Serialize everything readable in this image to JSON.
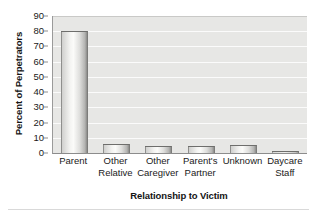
{
  "chart_data": {
    "type": "bar",
    "title": "",
    "subtitle": "",
    "xlabel": "Relationship to Victim",
    "ylabel": "Percent of Perpetrators",
    "categories": [
      "Parent",
      "Other Relative",
      "Other Caregiver",
      "Parent's Partner",
      "Unknown",
      "Daycare Staff"
    ],
    "category_lines": [
      [
        "Parent",
        ""
      ],
      [
        "Other",
        "Relative"
      ],
      [
        "Other",
        "Caregiver"
      ],
      [
        "Parent's",
        "Partner"
      ],
      [
        "Unknown",
        ""
      ],
      [
        "Daycare",
        "Staff"
      ]
    ],
    "values": [
      80,
      6,
      4.5,
      4.5,
      5,
      1
    ],
    "ylim": [
      0,
      90
    ],
    "ytick_values": [
      0,
      10,
      20,
      30,
      40,
      50,
      60,
      70,
      80,
      90
    ],
    "ytick_labels": [
      "0",
      "10",
      "20",
      "30",
      "40",
      "50",
      "60",
      "70",
      "80",
      "90"
    ],
    "grid": true,
    "grid_axis": "y",
    "legend": false,
    "legend_position": "none",
    "colors": {
      "plot_background": "#e7e7e5",
      "gridline": "#fbfbfb",
      "bar_fill_light": "#fbfbf9",
      "bar_fill_dark": "#8a8a88",
      "bar_outline": "#6e6e6c",
      "axis": "#8c8c8c",
      "text": "#1a1a1a"
    }
  }
}
